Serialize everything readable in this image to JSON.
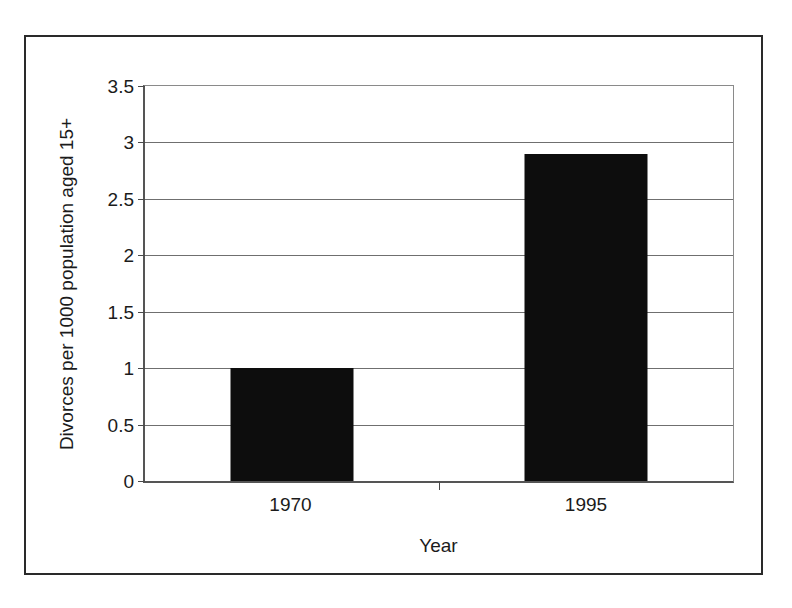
{
  "chart_data": {
    "type": "bar",
    "title": "",
    "categories": [
      "1970",
      "1995"
    ],
    "values": [
      1.0,
      2.9
    ],
    "series": [
      {
        "name": "Divorces per 1000 population aged 15+",
        "values": [
          1.0,
          2.9
        ]
      }
    ],
    "xlabel": "Year",
    "ylabel": "Divorces per 1000 population aged 15+",
    "ylim": [
      0,
      3.5
    ],
    "ytick_labels": [
      "0",
      "0.5",
      "1",
      "1.5",
      "2",
      "2.5",
      "3",
      "3.5"
    ],
    "ytick_values": [
      0,
      0.5,
      1,
      1.5,
      2,
      2.5,
      3,
      3.5
    ],
    "grid": true,
    "legend": false,
    "legend_position": "none",
    "bar_color": "#0d0d0d",
    "gridline_color": "#6f6f6f",
    "axis_color": "#555555",
    "background_color": "#ffffff"
  }
}
